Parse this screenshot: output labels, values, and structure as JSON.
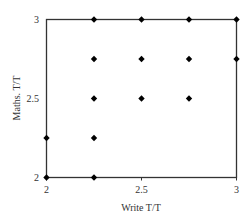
{
  "chart_data": {
    "type": "scatter",
    "title": "",
    "xlabel": "Write T/T",
    "ylabel": "Maths. T/T",
    "xlim": [
      2,
      3
    ],
    "ylim": [
      2,
      3
    ],
    "xticks": [
      2,
      2.5,
      3
    ],
    "yticks": [
      2,
      2.5,
      3
    ],
    "xtick_labels": [
      "2",
      "2.5",
      "3"
    ],
    "ytick_labels": [
      "2",
      "2.5",
      "3"
    ],
    "grid": false,
    "legend": null,
    "marker": "diamond",
    "marker_color": "#000000",
    "series": [
      {
        "name": "points",
        "points": [
          {
            "x": 2.25,
            "y": 3
          },
          {
            "x": 2.5,
            "y": 3
          },
          {
            "x": 2.75,
            "y": 3
          },
          {
            "x": 3,
            "y": 3
          },
          {
            "x": 2.25,
            "y": 2.75
          },
          {
            "x": 2.5,
            "y": 2.75
          },
          {
            "x": 2.75,
            "y": 2.75
          },
          {
            "x": 3,
            "y": 2.75
          },
          {
            "x": 2.25,
            "y": 2.5
          },
          {
            "x": 2.5,
            "y": 2.5
          },
          {
            "x": 2.75,
            "y": 2.5
          },
          {
            "x": 2,
            "y": 2.25
          },
          {
            "x": 2.25,
            "y": 2.25
          },
          {
            "x": 2,
            "y": 2
          },
          {
            "x": 2.25,
            "y": 2
          }
        ]
      }
    ]
  }
}
